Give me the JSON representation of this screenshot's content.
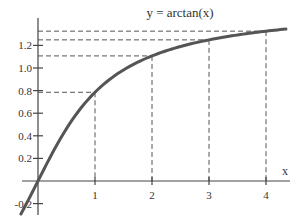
{
  "chart_data": {
    "type": "line",
    "title": "y = arctan(x)",
    "xlabel": "x",
    "ylabel": "",
    "xlim": [
      -0.3,
      4.4
    ],
    "ylim": [
      -0.27,
      1.5
    ],
    "x_ticks": [
      1,
      2,
      3,
      4
    ],
    "x_tick_labels": [
      "1",
      "2",
      "3",
      "4"
    ],
    "y_ticks": [
      -0.2,
      0.2,
      0.4,
      0.6,
      0.8,
      1.0,
      1.2
    ],
    "y_tick_labels": [
      "-0.2",
      "0.2",
      "0.4",
      "0.6",
      "0.8",
      "1.0",
      "1.2"
    ],
    "grid": false,
    "legend": null,
    "series": [
      {
        "name": "arctan(x)",
        "x": [
          -0.3,
          0,
          0.5,
          1,
          1.5,
          2,
          2.5,
          3,
          3.5,
          4,
          4.3
        ],
        "y": [
          -0.291,
          0,
          0.464,
          0.785,
          0.983,
          1.107,
          1.19,
          1.249,
          1.292,
          1.326,
          1.343
        ]
      }
    ],
    "annotations": [
      {
        "type": "dashed-guide",
        "x": 1,
        "y": 0.785
      },
      {
        "type": "dashed-guide",
        "x": 2,
        "y": 1.107
      },
      {
        "type": "dashed-guide",
        "x": 3,
        "y": 1.249
      },
      {
        "type": "dashed-guide",
        "x": 4,
        "y": 1.326
      }
    ]
  },
  "colors": {
    "curve": "#555555",
    "axis": "#444444",
    "dash": "#555555",
    "text": "#333333"
  }
}
